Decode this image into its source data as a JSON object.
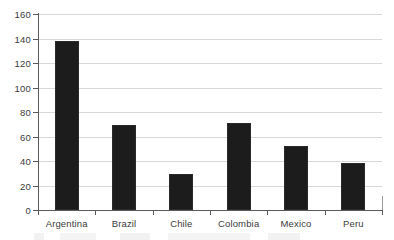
{
  "chart_data": {
    "type": "bar",
    "title": "",
    "xlabel": "",
    "ylabel": "",
    "categories": [
      "Argentina",
      "Brazil",
      "Chile",
      "Colombia",
      "Mexico",
      "Peru"
    ],
    "values": [
      138,
      69,
      29,
      71,
      52,
      38
    ],
    "ylim": [
      0,
      160
    ],
    "ytick_values": [
      0,
      20,
      40,
      60,
      80,
      100,
      120,
      140,
      160
    ],
    "ytick_labels": [
      "0",
      "20",
      "40",
      "60",
      "80",
      "100",
      "120",
      "140",
      "160"
    ],
    "grid": true,
    "legend": "none",
    "bar_color": "#1c1c1c",
    "gridline_color": "#d8d8d8",
    "axis_color": "#5a5a5a",
    "background_color": "#ffffff"
  }
}
